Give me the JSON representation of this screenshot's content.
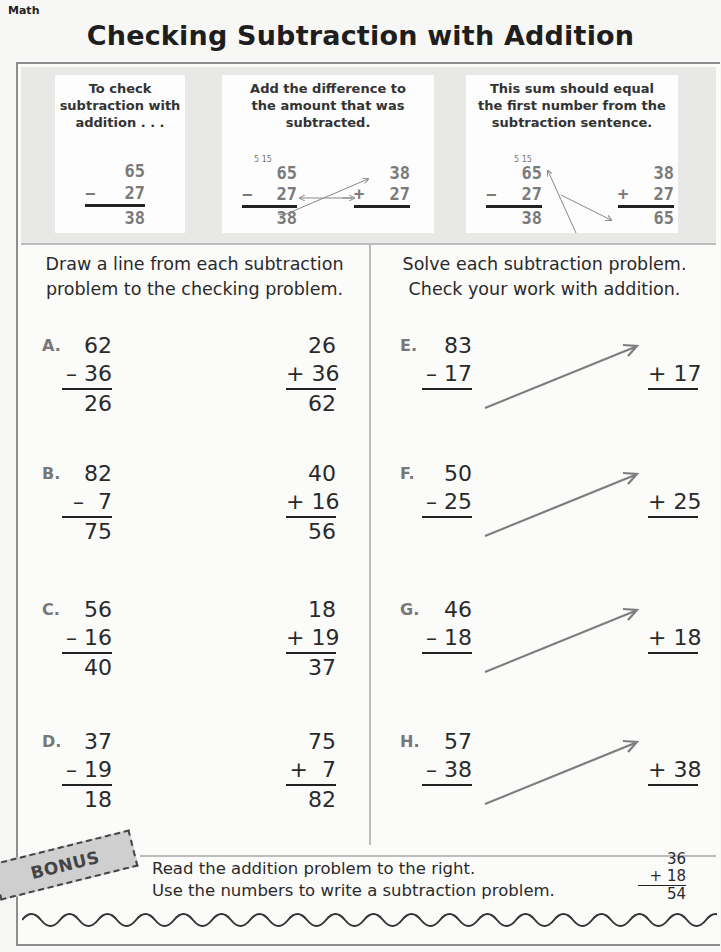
{
  "header": {
    "subject": "Math",
    "title": "Checking Subtraction with Addition"
  },
  "intro": {
    "cards": [
      {
        "text": [
          "To check",
          "subtraction with",
          "addition . . ."
        ],
        "example": {
          "top": "65",
          "op": "−",
          "bottom": "27",
          "result": "38"
        }
      },
      {
        "text": [
          "Add the difference to",
          "the amount that was",
          "subtracted."
        ],
        "regroup": "5 15",
        "subtraction": {
          "top": "65",
          "op": "−",
          "bottom": "27",
          "result": "38"
        },
        "addition": {
          "top": "38",
          "op": "+",
          "bottom": "27"
        }
      },
      {
        "text": [
          "This sum should equal",
          "the first number from the",
          "subtraction sentence."
        ],
        "regroup": "5 15",
        "subtraction": {
          "top": "65",
          "op": "−",
          "bottom": "27",
          "result": "38"
        },
        "addition": {
          "top": "38",
          "op": "+",
          "bottom": "27",
          "result": "65"
        }
      }
    ]
  },
  "left_section": {
    "instructions": [
      "Draw a line from each subtraction",
      "problem to the checking problem."
    ],
    "problems": [
      {
        "letter": "A.",
        "sub": {
          "top": "62",
          "bottom": "– 36",
          "result": "26"
        },
        "check": {
          "top": "26",
          "bottom": "+ 36",
          "result": "62"
        }
      },
      {
        "letter": "B.",
        "sub": {
          "top": "82",
          "bottom": "–  7",
          "result": "75"
        },
        "check": {
          "top": "40",
          "bottom": "+ 16",
          "result": "56"
        }
      },
      {
        "letter": "C.",
        "sub": {
          "top": "56",
          "bottom": "– 16",
          "result": "40"
        },
        "check": {
          "top": "18",
          "bottom": "+ 19",
          "result": "37"
        }
      },
      {
        "letter": "D.",
        "sub": {
          "top": "37",
          "bottom": "– 19",
          "result": "18"
        },
        "check": {
          "top": "75",
          "bottom": "+  7",
          "result": "82"
        }
      }
    ]
  },
  "right_section": {
    "instructions": [
      "Solve each subtraction problem.",
      "Check your work with addition."
    ],
    "problems": [
      {
        "letter": "E.",
        "top": "83",
        "bottom": "– 17",
        "check_bottom": "+ 17",
        "answer": "",
        "check_top": "",
        "check_result": ""
      },
      {
        "letter": "F.",
        "top": "50",
        "bottom": "– 25",
        "check_bottom": "+ 25",
        "answer": "",
        "check_top": "",
        "check_result": ""
      },
      {
        "letter": "G.",
        "top": "46",
        "bottom": "– 18",
        "check_bottom": "+ 18",
        "answer": "",
        "check_top": "",
        "check_result": ""
      },
      {
        "letter": "H.",
        "top": "57",
        "bottom": "– 38",
        "check_bottom": "+ 38",
        "answer": "",
        "check_top": "",
        "check_result": ""
      }
    ]
  },
  "bonus": {
    "badge": "BONUS",
    "text": [
      "Read the addition problem to the right.",
      "Use the numbers to write a subtraction problem."
    ],
    "problem": {
      "top": "36",
      "bottom": "+ 18",
      "result": "54"
    },
    "answer": ""
  },
  "colors": {
    "arrow": "#7d7d7d",
    "example_digits": "#7a7a7a",
    "badge_bg": "#c8c8c8"
  }
}
